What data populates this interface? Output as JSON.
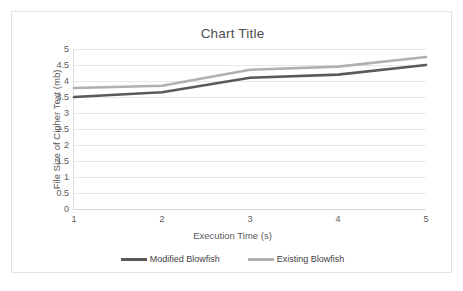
{
  "chart_data": {
    "type": "line",
    "title": "Chart Title",
    "xlabel": "Execution Time (s)",
    "ylabel": "File Size of Cipher Text (mb)",
    "categories": [
      "1",
      "2",
      "3",
      "4",
      "5"
    ],
    "x": [
      1,
      2,
      3,
      4,
      5
    ],
    "series": [
      {
        "name": "Modified Blowfish",
        "color": "#5a5a5a",
        "values": [
          3.5,
          3.65,
          4.1,
          4.2,
          4.5
        ]
      },
      {
        "name": "Existing Blowfish",
        "color": "#b0b0b0",
        "values": [
          3.78,
          3.85,
          4.35,
          4.45,
          4.75
        ]
      }
    ],
    "ylim": [
      0,
      5
    ],
    "ytick_labels": [
      "5",
      "4.5",
      "4",
      "3.5",
      "3",
      "2.5",
      "2",
      "1.5",
      "1",
      "0.5",
      "0"
    ],
    "ytick_values": [
      5,
      4.5,
      4,
      3.5,
      3,
      2.5,
      2,
      1.5,
      1,
      0.5,
      0
    ],
    "xtick_labels": [
      "1",
      "2",
      "3",
      "4",
      "5"
    ],
    "grid": "horizontal",
    "legend_position": "bottom",
    "gridline_color": "#e8e8e8",
    "axis_color": "#d9d9d9",
    "border_color": "#e2e2e2",
    "background": "#ffffff"
  },
  "legend": {
    "items": [
      {
        "label": "Modified Blowfish",
        "color": "#5a5a5a"
      },
      {
        "label": "Existing Blowfish",
        "color": "#b0b0b0"
      }
    ]
  }
}
